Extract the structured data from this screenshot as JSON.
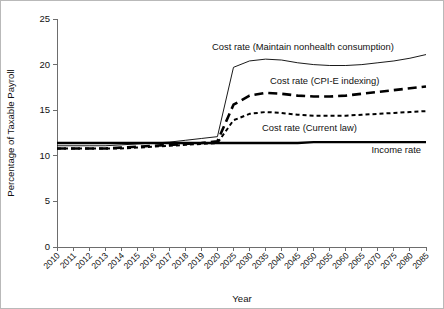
{
  "chart_data": {
    "type": "line",
    "title": "",
    "xlabel": "Year",
    "ylabel": "Percentage of Taxable Payroll",
    "ylim": [
      0,
      25
    ],
    "yticks": [
      0,
      5,
      10,
      15,
      20,
      25
    ],
    "grid": false,
    "legend_position": "inline-annotations",
    "categories": [
      "2010",
      "2011",
      "2012",
      "2013",
      "2014",
      "2015",
      "2016",
      "2017",
      "2018",
      "2019",
      "2020",
      "2025",
      "2030",
      "2035",
      "2040",
      "2045",
      "2050",
      "2055",
      "2060",
      "2065",
      "2070",
      "2075",
      "2080",
      "2085"
    ],
    "series": [
      {
        "name": "Cost rate (Maintain nonhealth consumption)",
        "style": "thin-solid",
        "values": [
          11.1,
          11.1,
          11.1,
          11.1,
          11.2,
          11.3,
          11.4,
          11.5,
          11.7,
          11.9,
          12.1,
          19.7,
          20.4,
          20.6,
          20.5,
          20.2,
          20.0,
          19.9,
          19.9,
          20.0,
          20.2,
          20.4,
          20.7,
          21.1
        ]
      },
      {
        "name": "Cost rate (CPI-E indexing)",
        "style": "long-dash",
        "values": [
          10.8,
          10.8,
          10.8,
          10.8,
          10.9,
          11.0,
          11.1,
          11.2,
          11.3,
          11.4,
          11.6,
          15.6,
          16.6,
          16.9,
          16.8,
          16.6,
          16.5,
          16.5,
          16.6,
          16.8,
          17.0,
          17.2,
          17.4,
          17.6
        ]
      },
      {
        "name": "Cost rate (Current law)",
        "style": "short-dash",
        "values": [
          10.8,
          10.8,
          10.8,
          10.8,
          10.8,
          10.9,
          11.0,
          11.1,
          11.2,
          11.3,
          11.4,
          13.9,
          14.6,
          14.8,
          14.7,
          14.5,
          14.4,
          14.4,
          14.4,
          14.5,
          14.6,
          14.7,
          14.8,
          14.9
        ]
      },
      {
        "name": "Income rate",
        "style": "thick-solid",
        "values": [
          11.4,
          11.4,
          11.4,
          11.4,
          11.4,
          11.4,
          11.4,
          11.4,
          11.4,
          11.4,
          11.4,
          11.4,
          11.4,
          11.4,
          11.4,
          11.4,
          11.5,
          11.5,
          11.5,
          11.5,
          11.5,
          11.5,
          11.5,
          11.5
        ]
      }
    ],
    "annotations": [
      {
        "name": "maintain-nonhealth-label",
        "text": "Cost rate (Maintain nonhealth consumption)",
        "x_px": 211,
        "y_px": 49,
        "anchor": "start"
      },
      {
        "name": "cpie-indexing-label",
        "text": "Cost rate (CPI-E indexing)",
        "x_px": 269,
        "y_px": 83,
        "anchor": "start"
      },
      {
        "name": "current-law-label",
        "text": "Cost rate (Current law)",
        "x_px": 261,
        "y_px": 130,
        "anchor": "start"
      },
      {
        "name": "income-rate-label",
        "text": "Income rate",
        "x_px": 420,
        "y_px": 152,
        "anchor": "end"
      }
    ]
  },
  "axes": {
    "y_title": "Percentage of Taxable Payroll",
    "x_title": "Year",
    "y_tick_labels": [
      "0",
      "5",
      "10",
      "15",
      "20",
      "25"
    ],
    "x_tick_labels": [
      "2010",
      "2011",
      "2012",
      "2013",
      "2014",
      "2015",
      "2016",
      "2017",
      "2018",
      "2019",
      "2020",
      "2025",
      "2030",
      "2035",
      "2040",
      "2045",
      "2050",
      "2055",
      "2060",
      "2065",
      "2070",
      "2075",
      "2080",
      "2085"
    ]
  },
  "colors": {
    "axis": "#6d6d6d",
    "series": "#000000",
    "background": "#ffffff",
    "frame": "#b9b9b9"
  }
}
